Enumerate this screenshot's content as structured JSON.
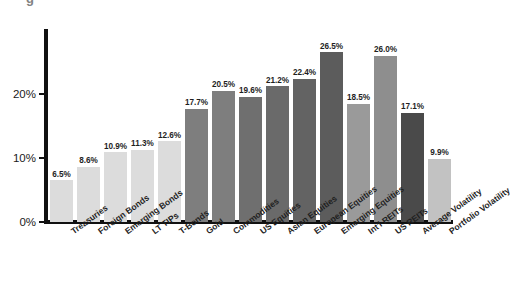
{
  "title_crop": "g",
  "chart_data": {
    "type": "bar",
    "title": "",
    "xlabel": "",
    "ylabel": "",
    "ylim": [
      0,
      30
    ],
    "grid": false,
    "legend": "none",
    "ytick_labels": [
      "0%",
      "10%",
      "20%"
    ],
    "ytick_values": [
      0,
      10,
      20
    ],
    "categories": [
      "Treasuries",
      "Foreign Bonds",
      "Emerging Bonds",
      "LT TIPs",
      "T-Bonds",
      "Gold",
      "Commodities",
      "US Equities",
      "Asian Equities",
      "European Equities",
      "Emerging Equities",
      "Int'l REITs",
      "US REITs",
      "Average Volatility",
      "Portfolio Volatility"
    ],
    "values": [
      6.5,
      8.6,
      10.9,
      11.3,
      12.6,
      17.7,
      20.5,
      19.6,
      21.2,
      22.4,
      26.5,
      18.5,
      26.0,
      17.1,
      9.9
    ],
    "value_labels": [
      "6.5%",
      "8.6%",
      "10.9%",
      "11.3%",
      "12.6%",
      "17.7%",
      "20.5%",
      "19.6%",
      "21.2%",
      "22.4%",
      "26.5%",
      "18.5%",
      "26.0%",
      "17.1%",
      "9.9%"
    ],
    "bar_colors": [
      "#dcdcdc",
      "#dcdcdc",
      "#dcdcdc",
      "#dcdcdc",
      "#dcdcdc",
      "#7e7e7e",
      "#7e7e7e",
      "#6f6f6f",
      "#6a6a6a",
      "#636363",
      "#5c5c5c",
      "#9a9a9a",
      "#8e8e8e",
      "#4a4a4a",
      "#c2c2c2"
    ],
    "axis_color": "#111111"
  }
}
